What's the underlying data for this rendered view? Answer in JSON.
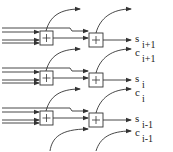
{
  "diagram": {
    "type": "carry-save adder array (bit slices)",
    "adder_symbol": "+",
    "stages": [
      {
        "offset_y": 0,
        "sum_label": "s",
        "sum_index": "i+1",
        "carry_label": "c",
        "carry_index": "i+1"
      },
      {
        "offset_y": 40,
        "sum_label": "s",
        "sum_index": "i",
        "carry_label": "c",
        "carry_index": "i"
      },
      {
        "offset_y": 80,
        "sum_label": "s",
        "sum_index": "i-1",
        "carry_label": "c",
        "carry_index": "i-1"
      }
    ],
    "colors": {
      "line": "#333333",
      "background": "#ffffff"
    }
  }
}
